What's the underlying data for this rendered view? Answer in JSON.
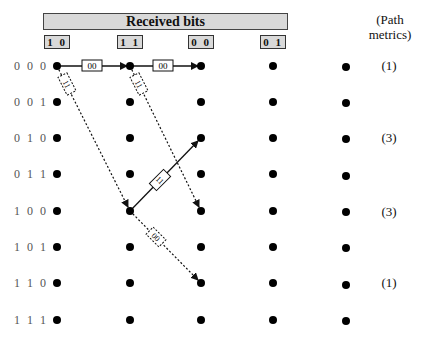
{
  "header": {
    "title": "Received bits"
  },
  "received_bits": [
    "1 0",
    "1 1",
    "0 0",
    "0 1"
  ],
  "legend": {
    "line1": "(Path",
    "line2": "metrics)"
  },
  "states": [
    "0 0 0",
    "0 0 1",
    "0 1 0",
    "0 1 1",
    "1 0 0",
    "1 0 1",
    "1 1 0",
    "1 1 1"
  ],
  "path_metrics": [
    {
      "state": "000",
      "value": "(1)"
    },
    {
      "state": "010",
      "value": "(3)"
    },
    {
      "state": "100",
      "value": "(3)"
    },
    {
      "state": "110",
      "value": "(1)"
    }
  ],
  "branches": [
    {
      "from": "t0:000",
      "to": "t1:000",
      "label": "00",
      "style": "solid"
    },
    {
      "from": "t1:000",
      "to": "t2:000",
      "label": "00",
      "style": "solid"
    },
    {
      "from": "t0:000",
      "to": "t1:100",
      "label": "11",
      "style": "dashed"
    },
    {
      "from": "t1:000",
      "to": "t2:100",
      "label": "11",
      "style": "dashed"
    },
    {
      "from": "t1:100",
      "to": "t2:010",
      "label": "11",
      "style": "solid"
    },
    {
      "from": "t1:100",
      "to": "t2:110",
      "label": "00",
      "style": "dashed"
    }
  ],
  "colors": {
    "header_fill": "#d9d9d9",
    "line": "#111111",
    "label_text": "#555555"
  }
}
